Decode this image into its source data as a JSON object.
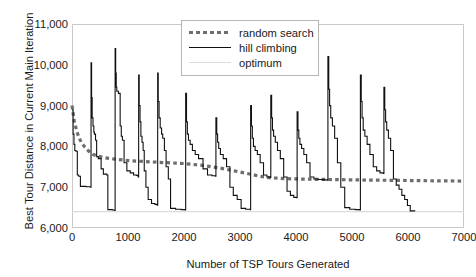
{
  "chart_data": {
    "type": "line",
    "title": "",
    "xlabel": "Number of TSP Tours Generated",
    "ylabel": "Best Tour Distance in Current Main Iteration",
    "xlim": [
      0,
      7000
    ],
    "ylim": [
      6000,
      11000
    ],
    "xticks": [
      0,
      1000,
      2000,
      3000,
      4000,
      5000,
      6000,
      7000
    ],
    "xticklabels": [
      "0",
      "1000",
      "2000",
      "3000",
      "4000",
      "5000",
      "6000",
      "7000"
    ],
    "yticks": [
      6000,
      7000,
      8000,
      9000,
      10000,
      11000
    ],
    "yticklabels": [
      "6,000",
      "7,000",
      "8,000",
      "9,000",
      "10,000",
      "11,000"
    ],
    "grid": false,
    "legend_position": "upper center",
    "colors": {
      "random_search": "#6e6e6e",
      "hill_climbing": "#111111",
      "optimum": "#dcdcdc",
      "frame": "#c9c9c9"
    },
    "series": [
      {
        "name": "random search",
        "style": "dotted",
        "color": "#6e6e6e",
        "points": [
          [
            0,
            9000
          ],
          [
            40,
            8620
          ],
          [
            80,
            8400
          ],
          [
            120,
            8230
          ],
          [
            170,
            8090
          ],
          [
            230,
            7980
          ],
          [
            300,
            7880
          ],
          [
            380,
            7800
          ],
          [
            470,
            7760
          ],
          [
            600,
            7720
          ],
          [
            760,
            7690
          ],
          [
            950,
            7660
          ],
          [
            1150,
            7640
          ],
          [
            1400,
            7620
          ],
          [
            1700,
            7600
          ],
          [
            2000,
            7580
          ],
          [
            2300,
            7540
          ],
          [
            2600,
            7480
          ],
          [
            2900,
            7400
          ],
          [
            3150,
            7330
          ],
          [
            3350,
            7270
          ],
          [
            3550,
            7230
          ],
          [
            3800,
            7210
          ],
          [
            4100,
            7200
          ],
          [
            4500,
            7190
          ],
          [
            5000,
            7180
          ],
          [
            5600,
            7170
          ],
          [
            6200,
            7160
          ],
          [
            7000,
            7150
          ]
        ]
      },
      {
        "name": "hill climbing",
        "style": "solid",
        "color": "#111111",
        "comment": "random-restart hill climbing: each restart spikes high then descends in steps",
        "points": [
          [
            0,
            8900
          ],
          [
            20,
            8300
          ],
          [
            35,
            8050
          ],
          [
            50,
            7900
          ],
          [
            70,
            7880
          ],
          [
            95,
            7300
          ],
          [
            120,
            7270
          ],
          [
            150,
            7020
          ],
          [
            250,
            7010
          ],
          [
            330,
            7000
          ],
          [
            340,
            10050
          ],
          [
            350,
            9200
          ],
          [
            360,
            8700
          ],
          [
            375,
            8500
          ],
          [
            390,
            8350
          ],
          [
            400,
            8300
          ],
          [
            420,
            8150
          ],
          [
            440,
            7750
          ],
          [
            470,
            7700
          ],
          [
            520,
            7450
          ],
          [
            560,
            7320
          ],
          [
            620,
            7300
          ],
          [
            640,
            6450
          ],
          [
            720,
            6440
          ],
          [
            760,
            6430
          ],
          [
            770,
            10400
          ],
          [
            780,
            9800
          ],
          [
            790,
            9450
          ],
          [
            800,
            9350
          ],
          [
            830,
            9300
          ],
          [
            860,
            8500
          ],
          [
            880,
            8250
          ],
          [
            900,
            8150
          ],
          [
            930,
            7600
          ],
          [
            980,
            7400
          ],
          [
            1040,
            7350
          ],
          [
            1100,
            7300
          ],
          [
            1150,
            7290
          ],
          [
            1180,
            7250
          ],
          [
            1190,
            9750
          ],
          [
            1200,
            9000
          ],
          [
            1215,
            8600
          ],
          [
            1230,
            8250
          ],
          [
            1250,
            8100
          ],
          [
            1270,
            7900
          ],
          [
            1290,
            7400
          ],
          [
            1320,
            7000
          ],
          [
            1360,
            6700
          ],
          [
            1420,
            6600
          ],
          [
            1480,
            6580
          ],
          [
            1520,
            6560
          ],
          [
            1530,
            9800
          ],
          [
            1540,
            9100
          ],
          [
            1555,
            8700
          ],
          [
            1575,
            8450
          ],
          [
            1600,
            8300
          ],
          [
            1620,
            8200
          ],
          [
            1650,
            7900
          ],
          [
            1680,
            7500
          ],
          [
            1720,
            7200
          ],
          [
            1760,
            6480
          ],
          [
            1850,
            6460
          ],
          [
            1950,
            6450
          ],
          [
            2020,
            6440
          ],
          [
            2030,
            9300
          ],
          [
            2045,
            8600
          ],
          [
            2060,
            8300
          ],
          [
            2080,
            8150
          ],
          [
            2110,
            8050
          ],
          [
            2150,
            7900
          ],
          [
            2200,
            7800
          ],
          [
            2260,
            7700
          ],
          [
            2340,
            7450
          ],
          [
            2420,
            7300
          ],
          [
            2500,
            7280
          ],
          [
            2560,
            7270
          ],
          [
            2570,
            8700
          ],
          [
            2585,
            8300
          ],
          [
            2600,
            8100
          ],
          [
            2620,
            7950
          ],
          [
            2650,
            7800
          ],
          [
            2700,
            7700
          ],
          [
            2760,
            7500
          ],
          [
            2820,
            7000
          ],
          [
            2880,
            6800
          ],
          [
            2950,
            6700
          ],
          [
            3020,
            6480
          ],
          [
            3100,
            6460
          ],
          [
            3180,
            6450
          ],
          [
            3190,
            9000
          ],
          [
            3205,
            8500
          ],
          [
            3220,
            8200
          ],
          [
            3240,
            8000
          ],
          [
            3270,
            7900
          ],
          [
            3310,
            7800
          ],
          [
            3360,
            7600
          ],
          [
            3420,
            7300
          ],
          [
            3480,
            7250
          ],
          [
            3540,
            7240
          ],
          [
            3550,
            9250
          ],
          [
            3565,
            8700
          ],
          [
            3580,
            8400
          ],
          [
            3600,
            8250
          ],
          [
            3630,
            8100
          ],
          [
            3670,
            7900
          ],
          [
            3720,
            7700
          ],
          [
            3780,
            7250
          ],
          [
            3840,
            6900
          ],
          [
            3900,
            6800
          ],
          [
            3960,
            6750
          ],
          [
            4010,
            6740
          ],
          [
            4020,
            8850
          ],
          [
            4035,
            8400
          ],
          [
            4050,
            8200
          ],
          [
            4070,
            8050
          ],
          [
            4100,
            7950
          ],
          [
            4140,
            7800
          ],
          [
            4190,
            7600
          ],
          [
            4250,
            7250
          ],
          [
            4320,
            7200
          ],
          [
            4400,
            7190
          ],
          [
            4480,
            7180
          ],
          [
            4560,
            7170
          ],
          [
            4570,
            10200
          ],
          [
            4585,
            9400
          ],
          [
            4600,
            9000
          ],
          [
            4620,
            8700
          ],
          [
            4650,
            8500
          ],
          [
            4690,
            8200
          ],
          [
            4740,
            7600
          ],
          [
            4800,
            7000
          ],
          [
            4870,
            6500
          ],
          [
            4960,
            6460
          ],
          [
            5060,
            6450
          ],
          [
            5140,
            6440
          ],
          [
            5150,
            9750
          ],
          [
            5165,
            9100
          ],
          [
            5180,
            8700
          ],
          [
            5200,
            8400
          ],
          [
            5230,
            8250
          ],
          [
            5270,
            8050
          ],
          [
            5320,
            7800
          ],
          [
            5380,
            7500
          ],
          [
            5440,
            7400
          ],
          [
            5500,
            7350
          ],
          [
            5560,
            7340
          ],
          [
            5570,
            9450
          ],
          [
            5585,
            8900
          ],
          [
            5600,
            8600
          ],
          [
            5620,
            8400
          ],
          [
            5650,
            8200
          ],
          [
            5690,
            7900
          ],
          [
            5740,
            7200
          ],
          [
            5790,
            7050
          ],
          [
            5840,
            6950
          ],
          [
            5890,
            6800
          ],
          [
            5940,
            6700
          ],
          [
            5990,
            6550
          ],
          [
            6040,
            6420
          ],
          [
            6120,
            6410
          ]
        ]
      },
      {
        "name": "optimum",
        "style": "solid-light",
        "color": "#dcdcdc",
        "value": 6400,
        "points": [
          [
            0,
            6400
          ],
          [
            7000,
            6400
          ]
        ]
      }
    ]
  },
  "legend": {
    "items": [
      {
        "label": "random search",
        "key": "dotted"
      },
      {
        "label": "hill climbing",
        "key": "solid"
      },
      {
        "label": "optimum",
        "key": "optimum"
      }
    ]
  }
}
